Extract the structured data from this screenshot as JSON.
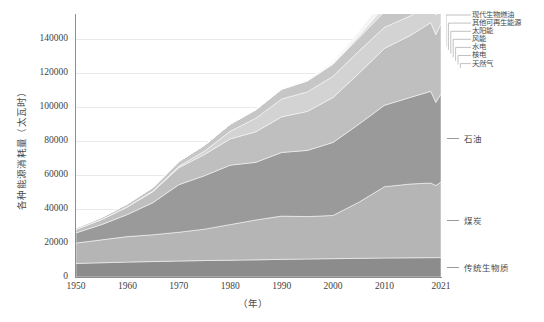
{
  "chart_data": {
    "type": "area",
    "stacked": true,
    "title": "",
    "xlabel": "（年）",
    "ylabel": "各种能源消耗量（太瓦时）",
    "xlim": [
      1950,
      2021
    ],
    "ylim": [
      0,
      155000
    ],
    "ytick_labels": [
      "0",
      "20000",
      "40000",
      "60000",
      "80000",
      "100000",
      "120000",
      "140000"
    ],
    "ytick_values": [
      0,
      20000,
      40000,
      60000,
      80000,
      100000,
      120000,
      140000
    ],
    "xtick_labels": [
      "1950",
      "1960",
      "1970",
      "1980",
      "1990",
      "2000",
      "2010",
      "2021"
    ],
    "xtick_values": [
      1950,
      1960,
      1970,
      1980,
      1990,
      2000,
      2010,
      2021
    ],
    "grid": true,
    "legend_position": "top-right",
    "x": [
      1950,
      1955,
      1960,
      1965,
      1970,
      1975,
      1980,
      1985,
      1990,
      1995,
      2000,
      2005,
      2010,
      2015,
      2019,
      2020,
      2021
    ],
    "series": [
      {
        "name": "传统生物质",
        "color": "#8c8c8c",
        "values": [
          8000,
          8400,
          8800,
          9100,
          9400,
          9700,
          9900,
          10100,
          10400,
          10600,
          10800,
          11000,
          11200,
          11300,
          11400,
          11400,
          11450
        ]
      },
      {
        "name": "煤炭",
        "color": "#b5b5b5",
        "values": [
          12000,
          13500,
          15000,
          15800,
          17000,
          18500,
          21000,
          23500,
          25500,
          25000,
          25500,
          33000,
          42000,
          43500,
          44000,
          42500,
          44500
        ]
      },
      {
        "name": "石油",
        "color": "#9a9a9a",
        "values": [
          6000,
          9000,
          13000,
          19000,
          28000,
          31500,
          35000,
          34000,
          37500,
          39000,
          43000,
          46000,
          48000,
          51000,
          54000,
          49000,
          52000
        ]
      },
      {
        "name": "天然气",
        "color": "#bfbfbf",
        "values": [
          2000,
          3000,
          4500,
          6500,
          10000,
          12500,
          15500,
          18000,
          21000,
          23000,
          26500,
          30000,
          33500,
          36500,
          40500,
          40000,
          41500
        ]
      },
      {
        "name": "核电",
        "color": "#d3d3d3",
        "values": [
          0,
          0,
          100,
          300,
          800,
          2000,
          4500,
          8000,
          10500,
          11500,
          12500,
          13000,
          12500,
          11500,
          12000,
          11500,
          12000
        ]
      },
      {
        "name": "水电",
        "color": "#c6c6c6",
        "values": [
          900,
          1200,
          1700,
          2200,
          2900,
          3500,
          4200,
          5000,
          5700,
          6400,
          7100,
          7900,
          9200,
          10500,
          11400,
          11600,
          11800
        ]
      },
      {
        "name": "风能",
        "color": "#dcdcdc",
        "values": [
          0,
          0,
          0,
          0,
          0,
          0,
          0,
          20,
          100,
          200,
          500,
          1200,
          2800,
          5700,
          9500,
          10500,
          11800
        ]
      },
      {
        "name": "太阳能",
        "color": "#e4e4e4",
        "values": [
          0,
          0,
          0,
          0,
          0,
          0,
          0,
          0,
          10,
          20,
          50,
          200,
          800,
          3000,
          7000,
          8500,
          10500
        ]
      },
      {
        "name": "其他可再生能源",
        "color": "#ededed",
        "values": [
          0,
          0,
          0,
          0,
          0,
          0,
          50,
          100,
          200,
          350,
          600,
          1000,
          1600,
          2300,
          2900,
          2950,
          3100
        ]
      },
      {
        "name": "现代生物燃油",
        "color": "#f2f2f2",
        "values": [
          0,
          0,
          0,
          0,
          0,
          0,
          20,
          60,
          150,
          300,
          600,
          1200,
          2300,
          2900,
          3100,
          2900,
          3200
        ]
      }
    ],
    "peak_note": "总量峰值约 2019 年，2020 年下降，2021 年回升"
  },
  "legend": {
    "items": [
      {
        "label": "现代生物燃油"
      },
      {
        "label": "其他可再生能源"
      },
      {
        "label": "太阳能"
      },
      {
        "label": "风能"
      },
      {
        "label": "水电"
      },
      {
        "label": "核电"
      },
      {
        "label": "天然气"
      }
    ]
  },
  "annotations": [
    {
      "label": "石油"
    },
    {
      "label": "煤炭"
    },
    {
      "label": "传统生物质"
    }
  ]
}
